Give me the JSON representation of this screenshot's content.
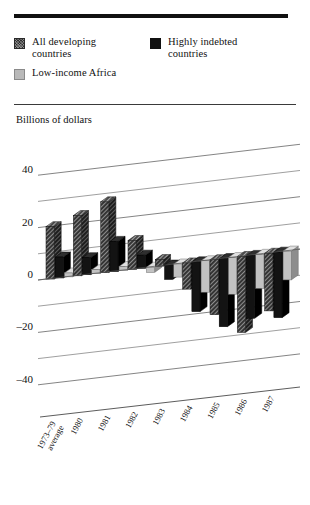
{
  "figure": {
    "axis_caption": "Billions of dollars",
    "legend": [
      {
        "name": "legend-all-developing",
        "label": "All developing\ncountries",
        "swatch": "dark-hatch",
        "color": "#2f2f2f"
      },
      {
        "name": "legend-highly-indebted",
        "label": "Highly indebted\ncountries",
        "swatch": "solid-black",
        "color": "#111111"
      },
      {
        "name": "legend-low-income-africa",
        "label": "Low-income Africa",
        "swatch": "light-gray",
        "color": "#b9b9b9"
      }
    ],
    "legend_lines": {
      "all_developing_1": "All developing",
      "all_developing_2": "countries",
      "highly_indebted_1": "Highly indebted",
      "highly_indebted_2": "countries",
      "low_income_africa": "Low-income Africa"
    }
  },
  "chart_data": {
    "type": "bar",
    "title": "",
    "xlabel": "",
    "ylabel": "Billions of dollars",
    "ylim": [
      -50,
      45
    ],
    "yticks": [
      40,
      20,
      0,
      -20,
      -40
    ],
    "ytick_labels": [
      "40",
      "20",
      "0",
      "–20",
      "–40"
    ],
    "minor_gridlines": [
      30,
      10,
      -10,
      -30
    ],
    "grid": true,
    "grid_style": "slanted-pseudo-3d",
    "legend_position": "above-plot",
    "categories": [
      "1973–79\naverage",
      "1980",
      "1981",
      "1982",
      "1983",
      "1984",
      "1985",
      "1986",
      "1987"
    ],
    "category_labels": [
      "1973–79",
      "average",
      "1980",
      "1981",
      "1982",
      "1983",
      "1984",
      "1985",
      "1986",
      "1987"
    ],
    "series": [
      {
        "name": "All developing countries",
        "color": "#2f2f2f",
        "pattern": "dark-hatch",
        "values": [
          20,
          23,
          27,
          11,
          2.5,
          -10,
          -21,
          -29,
          -22
        ]
      },
      {
        "name": "Highly indebted countries",
        "color": "#111111",
        "pattern": "solid",
        "values": [
          8,
          6.5,
          11.5,
          5,
          -5.5,
          -19,
          -26,
          -24,
          -25
        ]
      },
      {
        "name": "Low-income Africa",
        "color": "#b9b9b9",
        "pattern": "solid-light",
        "values": [
          1.5,
          1.5,
          1.5,
          -2,
          -5,
          -12,
          -14,
          -13,
          -11
        ]
      }
    ]
  }
}
